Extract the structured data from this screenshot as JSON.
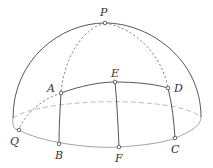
{
  "figure": {
    "points": {
      "P": {
        "label": "P"
      },
      "A": {
        "label": "A"
      },
      "E": {
        "label": "E"
      },
      "D": {
        "label": "D"
      },
      "Q": {
        "label": "Q"
      },
      "B": {
        "label": "B"
      },
      "F": {
        "label": "F"
      },
      "C": {
        "label": "C"
      }
    },
    "colors": {
      "outline": "#444444",
      "base_rim": "#9a9a9a",
      "hidden": "#aaaaaa",
      "background": "#ffffff"
    }
  }
}
